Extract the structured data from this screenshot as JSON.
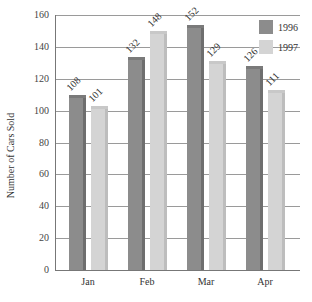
{
  "chart_data": {
    "type": "bar",
    "title": "",
    "xlabel": "",
    "ylabel": "Number of Cars Sold",
    "categories": [
      "Jan",
      "Feb",
      "Mar",
      "Apr"
    ],
    "series": [
      {
        "name": "1996",
        "values": [
          108,
          132,
          152,
          126
        ],
        "color": "#8c8c8c"
      },
      {
        "name": "1997",
        "values": [
          101,
          148,
          129,
          111
        ],
        "color": "#d4d4d4"
      }
    ],
    "ylim": [
      0,
      160
    ],
    "yticks": [
      0,
      20,
      40,
      60,
      80,
      100,
      120,
      140,
      160
    ],
    "grid": true,
    "legend_position": "top-right",
    "data_labels": true
  }
}
